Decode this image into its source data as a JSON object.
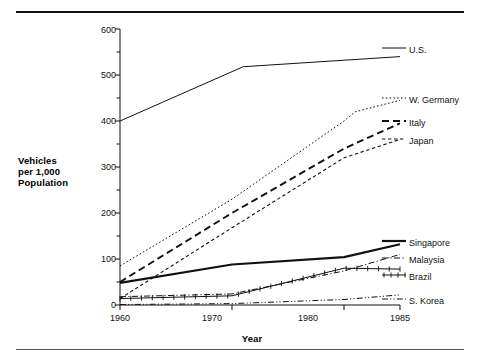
{
  "figure": {
    "has_top_rule": true,
    "has_bottom_rule": true,
    "background": "#ffffff",
    "ink": "#111111"
  },
  "chart_data": {
    "type": "line",
    "title": "",
    "xlabel": "Year",
    "ylabel": "Vehicles per 1,000 Population",
    "ylabel_lines": [
      "Vehicles",
      "per 1,000",
      "Population"
    ],
    "x": [
      1960,
      1970,
      1980,
      1985
    ],
    "xlim": [
      1960,
      1985
    ],
    "ylim": [
      0,
      600
    ],
    "xticks": [
      1960,
      1970,
      1980,
      1985
    ],
    "xticklabels": [
      "1960",
      "1970",
      "1980",
      "1985"
    ],
    "yticks": [
      0,
      100,
      200,
      300,
      400,
      500,
      600
    ],
    "yticklabels": [
      "0",
      "100",
      "200",
      "300",
      "400",
      "500",
      "600"
    ],
    "y_minor_tick_interval": 50,
    "grid": false,
    "legend_position": "right-inline",
    "series": [
      {
        "name": "U.S.",
        "label": "U.S.",
        "style": "solid-thin",
        "color": "#111111",
        "points": [
          {
            "x": 1960,
            "y": 400
          },
          {
            "x": 1971,
            "y": 518
          },
          {
            "x": 1985,
            "y": 540
          }
        ],
        "values": [
          400,
          512,
          532,
          540
        ]
      },
      {
        "name": "W. Germany",
        "label": "W. Germany",
        "style": "dotted",
        "color": "#111111",
        "points": [
          {
            "x": 1960,
            "y": 85
          },
          {
            "x": 1970,
            "y": 230
          },
          {
            "x": 1980,
            "y": 400
          },
          {
            "x": 1981,
            "y": 420
          },
          {
            "x": 1985,
            "y": 445
          }
        ],
        "values": [
          85,
          230,
          400,
          445
        ]
      },
      {
        "name": "Italy",
        "label": "Italy",
        "style": "dashed-long",
        "color": "#111111",
        "points": [
          {
            "x": 1960,
            "y": 50
          },
          {
            "x": 1970,
            "y": 200
          },
          {
            "x": 1980,
            "y": 340
          },
          {
            "x": 1985,
            "y": 395
          }
        ],
        "values": [
          50,
          200,
          340,
          395
        ]
      },
      {
        "name": "Japan",
        "label": "Japan",
        "style": "dashed-short",
        "color": "#111111",
        "points": [
          {
            "x": 1960,
            "y": 14
          },
          {
            "x": 1970,
            "y": 168
          },
          {
            "x": 1980,
            "y": 320
          },
          {
            "x": 1985,
            "y": 360
          }
        ],
        "values": [
          14,
          168,
          320,
          360
        ]
      },
      {
        "name": "Singapore",
        "label": "Singapore",
        "style": "solid-thick",
        "color": "#111111",
        "points": [
          {
            "x": 1960,
            "y": 48
          },
          {
            "x": 1970,
            "y": 88
          },
          {
            "x": 1980,
            "y": 104
          },
          {
            "x": 1985,
            "y": 132
          }
        ],
        "values": [
          48,
          88,
          104,
          132
        ]
      },
      {
        "name": "Malaysia",
        "label": "Malaysia",
        "style": "dash-dot",
        "color": "#111111",
        "points": [
          {
            "x": 1960,
            "y": 18
          },
          {
            "x": 1970,
            "y": 24
          },
          {
            "x": 1980,
            "y": 74
          },
          {
            "x": 1985,
            "y": 110
          }
        ],
        "values": [
          18,
          24,
          74,
          110
        ]
      },
      {
        "name": "Brazil",
        "label": "Brazil",
        "style": "cross-marked",
        "color": "#111111",
        "points": [
          {
            "x": 1960,
            "y": 14
          },
          {
            "x": 1970,
            "y": 20
          },
          {
            "x": 1980,
            "y": 80
          },
          {
            "x": 1985,
            "y": 78
          }
        ],
        "values": [
          14,
          20,
          80,
          78
        ]
      },
      {
        "name": "S. Korea",
        "label": "S. Korea",
        "style": "dash-dot-dot",
        "color": "#111111",
        "points": [
          {
            "x": 1960,
            "y": 1
          },
          {
            "x": 1970,
            "y": 3
          },
          {
            "x": 1980,
            "y": 12
          },
          {
            "x": 1985,
            "y": 22
          }
        ],
        "values": [
          1,
          3,
          12,
          22
        ]
      }
    ]
  }
}
